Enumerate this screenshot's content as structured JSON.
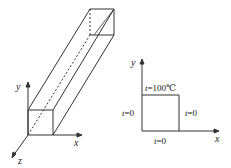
{
  "figure": {
    "left": {
      "description": "3D rectangular bar with coordinate axes",
      "axes": {
        "x": "x",
        "y": "y",
        "z": "z"
      }
    },
    "right": {
      "description": "Cross-section with boundary temperatures",
      "axes": {
        "x": "x",
        "y": "y"
      },
      "boundaries": {
        "top": {
          "var": "t",
          "eq": "=100℃"
        },
        "left": {
          "var": "t",
          "eq": "=0"
        },
        "right": {
          "var": "t",
          "eq": "=0"
        },
        "bottom": {
          "var": "t",
          "eq": "=0"
        }
      }
    },
    "colors": {
      "line": "#333333",
      "background": "#ffffff"
    }
  }
}
